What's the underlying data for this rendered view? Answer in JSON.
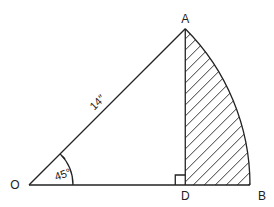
{
  "diagram": {
    "type": "geometry-sector",
    "points": {
      "O": "O",
      "A": "A",
      "B": "B",
      "D": "D"
    },
    "labels": {
      "radius": "14″",
      "angle": "45°"
    },
    "radius_value": 14,
    "radius_unit": "in",
    "angle_degrees": 45,
    "shaded_region": "ADB",
    "right_angle_at": "D",
    "colors": {
      "ink": "#222222",
      "background": "#ffffff"
    }
  }
}
